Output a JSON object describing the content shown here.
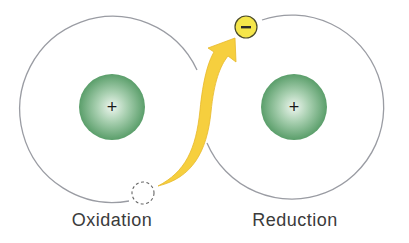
{
  "diagram": {
    "left_atom": {
      "label": "Oxidation",
      "nucleus_charge": "+",
      "electron_vacancy": "dashed circle (electron lost)"
    },
    "right_atom": {
      "label": "Reduction",
      "nucleus_charge": "+",
      "electron": "−"
    },
    "arrow": {
      "from": "left atom vacancy",
      "to": "right atom electron",
      "meaning": "electron transfer"
    },
    "colors": {
      "orbit": "#9a9ca3",
      "nucleus_outer": "#5a9e6a",
      "nucleus_inner": "#e8f3ea",
      "arrow": "#f6cf3e",
      "electron_fill": "#f5e64a",
      "electron_stroke": "#4a4a2a",
      "label_text": "#3b3b3b"
    }
  }
}
